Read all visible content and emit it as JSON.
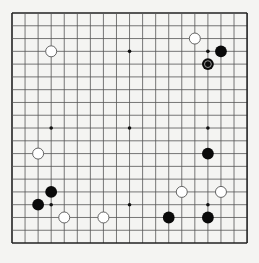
{
  "board": {
    "size": 19,
    "origin": {
      "x": 12,
      "y": 13
    },
    "spacing": {
      "x": 13.06,
      "y": 12.78
    },
    "colors": {
      "background": "#f4f4f2",
      "line": "#555555",
      "border": "#222222",
      "black_stone": "#0a0a0a",
      "white_stone_fill": "#ffffff",
      "white_stone_stroke": "#555555",
      "marker_ring": "#9a9a9a"
    },
    "star_points": [
      [
        3,
        3
      ],
      [
        9,
        3
      ],
      [
        15,
        3
      ],
      [
        3,
        9
      ],
      [
        9,
        9
      ],
      [
        15,
        9
      ],
      [
        3,
        15
      ],
      [
        9,
        15
      ],
      [
        15,
        15
      ]
    ],
    "stones": [
      {
        "color": "white",
        "col": 3,
        "row": 3
      },
      {
        "color": "white",
        "col": 14,
        "row": 2
      },
      {
        "color": "black",
        "col": 16,
        "row": 3
      },
      {
        "color": "black",
        "col": 15,
        "row": 4,
        "marked": true
      },
      {
        "color": "black",
        "col": 15,
        "row": 11
      },
      {
        "color": "white",
        "col": 2,
        "row": 11
      },
      {
        "color": "white",
        "col": 13,
        "row": 14
      },
      {
        "color": "white",
        "col": 16,
        "row": 14
      },
      {
        "color": "black",
        "col": 3,
        "row": 14
      },
      {
        "color": "black",
        "col": 2,
        "row": 15
      },
      {
        "color": "white",
        "col": 4,
        "row": 16
      },
      {
        "color": "white",
        "col": 7,
        "row": 16
      },
      {
        "color": "black",
        "col": 12,
        "row": 16
      },
      {
        "color": "black",
        "col": 15,
        "row": 16
      }
    ],
    "last_move_marker": "ring-icon"
  }
}
